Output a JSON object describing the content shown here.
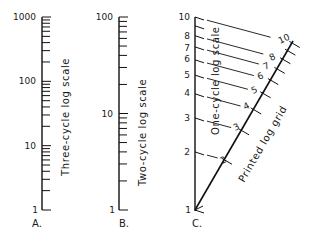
{
  "figure": {
    "panels": [
      {
        "id": "A",
        "caption": "A.",
        "axis_label": "Three-cycle log scale",
        "cycles": 3,
        "tick_labels": [
          "1",
          "10",
          "100",
          "1000"
        ]
      },
      {
        "id": "B",
        "caption": "B.",
        "axis_label": "Two-cycle log scale",
        "cycles": 2,
        "tick_labels": [
          "1",
          "10",
          "100"
        ]
      },
      {
        "id": "C",
        "caption": "C.",
        "vertical_axis_label": "One-cycle log scale",
        "diagonal_axis_label": "Printed log grid",
        "cycles": 1,
        "vertical_tick_labels": [
          "1",
          "2",
          "3",
          "4",
          "5",
          "6",
          "7",
          "8",
          "10"
        ],
        "diagonal_tick_labels": [
          "2",
          "3",
          "4",
          "5",
          "6",
          "7",
          "8",
          "10"
        ]
      }
    ]
  },
  "colors": {
    "ink": "#111111",
    "background": "#ffffff"
  }
}
